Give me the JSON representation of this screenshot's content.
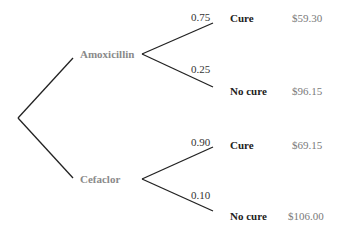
{
  "tree": {
    "options": [
      {
        "label": "Amoxicillin",
        "branches": [
          {
            "probability": "0.75",
            "outcome": "Cure",
            "cost": "$59.30"
          },
          {
            "probability": "0.25",
            "outcome": "No cure",
            "cost": "$96.15"
          }
        ]
      },
      {
        "label": "Cefaclor",
        "branches": [
          {
            "probability": "0.90",
            "outcome": "Cure",
            "cost": "$69.15"
          },
          {
            "probability": "0.10",
            "outcome": "No cure",
            "cost": "$106.00"
          }
        ]
      }
    ]
  },
  "colors": {
    "line": "#222222",
    "node_label": "#8a8a8a",
    "cost": "#7a7a7a"
  }
}
